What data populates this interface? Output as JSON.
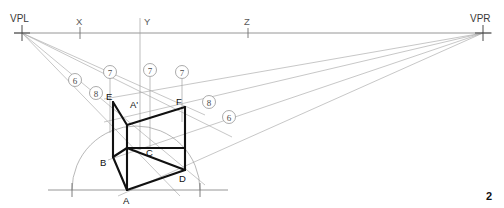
{
  "figure": {
    "caption_number": "2"
  },
  "horizon": {
    "y": 33,
    "x_start": 14,
    "x_end": 492,
    "labels": [
      {
        "name": "VPL",
        "text": "VPL",
        "x": 10,
        "y": 19,
        "tick_x": 22
      },
      {
        "name": "X",
        "text": "X",
        "x": 76,
        "y": 25,
        "tick_x": 80
      },
      {
        "name": "Y",
        "text": "Y",
        "x": 144,
        "y": 25,
        "tick_x": 140
      },
      {
        "name": "Z",
        "text": "Z",
        "x": 244,
        "y": 25,
        "tick_x": 248
      },
      {
        "name": "VPR",
        "text": "VPR",
        "x": 472,
        "y": 19,
        "tick_x": 483
      }
    ]
  },
  "vanishing_points": {
    "left": {
      "label": "VPL",
      "x": 22,
      "y": 33
    },
    "right": {
      "label": "VPR",
      "x": 483,
      "y": 33
    }
  },
  "ground_line": {
    "y": 190,
    "x_start": 48,
    "x_end": 228,
    "tick_left_x": 72,
    "tick_right_x": 200
  },
  "arc": {
    "center_x": 136,
    "center_y": 190,
    "radius": 64,
    "description": "semicircular measuring arc on ground line"
  },
  "cube": {
    "vertices": [
      {
        "name": "A",
        "label": "A",
        "x": 127,
        "y": 190,
        "label_x": 123,
        "label_y": 203
      },
      {
        "name": "A1",
        "label": "A'",
        "x": 127,
        "y": 125,
        "label_x": 131,
        "label_y": 107
      },
      {
        "name": "B",
        "label": "B",
        "x": 113,
        "y": 157,
        "label_x": 101,
        "label_y": 166
      },
      {
        "name": "C",
        "label": "C",
        "x": 185,
        "y": 148,
        "label_x": 147,
        "label_y": 155
      },
      {
        "name": "D",
        "label": "D",
        "x": 185,
        "y": 170,
        "label_x": 180,
        "label_y": 182
      },
      {
        "name": "E",
        "label": "E",
        "x": 113,
        "y": 102,
        "label_x": 107,
        "label_y": 99
      },
      {
        "name": "F",
        "label": "F",
        "x": 185,
        "y": 107,
        "label_x": 177,
        "label_y": 104
      }
    ],
    "edges": [
      "E-A1",
      "A1-F",
      "E-B",
      "F-D",
      "B-A",
      "A-D",
      "B-C",
      "C-D",
      "A1-A",
      "A1-C"
    ]
  },
  "callouts": [
    {
      "name": "callout-6-left",
      "text": "6",
      "cx": 75,
      "cy": 80,
      "r": 6.5
    },
    {
      "name": "callout-8-left",
      "text": "8",
      "cx": 96,
      "cy": 93,
      "r": 6.5
    },
    {
      "name": "callout-7-a",
      "text": "7",
      "cx": 110,
      "cy": 72,
      "r": 6.5
    },
    {
      "name": "callout-7-b",
      "text": "7",
      "cx": 150,
      "cy": 70,
      "r": 6.5
    },
    {
      "name": "callout-7-c",
      "text": "7",
      "cx": 182,
      "cy": 72,
      "r": 6.5
    },
    {
      "name": "callout-8-right",
      "text": "8",
      "cx": 209,
      "cy": 102,
      "r": 6.5
    },
    {
      "name": "callout-6-right",
      "text": "6",
      "cx": 229,
      "cy": 117,
      "r": 6.5
    }
  ],
  "vertical_guides": [
    {
      "name": "guide-7-a",
      "x": 110,
      "y_top": 78,
      "y_bottom": 130
    },
    {
      "name": "guide-7-b",
      "x": 150,
      "y_top": 76,
      "y_bottom": 145
    },
    {
      "name": "guide-7-c",
      "x": 182,
      "y_top": 78,
      "y_bottom": 120
    },
    {
      "name": "guide-y",
      "x": 140,
      "y_top": 18,
      "y_bottom": 145
    }
  ],
  "rays_from_vpl": [
    {
      "name": "ray-vpl-to-E",
      "to_x": 200,
      "to_y": 114
    },
    {
      "name": "ray-vpl-to-A1",
      "to_x": 200,
      "to_y": 133
    },
    {
      "name": "ray-vpl-to-B",
      "to_x": 200,
      "to_y": 172
    },
    {
      "name": "ray-vpl-to-A",
      "to_x": 190,
      "to_y": 196
    }
  ],
  "rays_from_vpr": [
    {
      "name": "ray-vpr-to-F",
      "to_x": 108,
      "to_y": 100
    },
    {
      "name": "ray-vpr-to-A1",
      "to_x": 108,
      "to_y": 122
    },
    {
      "name": "ray-vpr-to-D",
      "to_x": 108,
      "to_y": 157
    },
    {
      "name": "ray-vpr-to-A",
      "to_x": 120,
      "to_y": 194
    }
  ]
}
